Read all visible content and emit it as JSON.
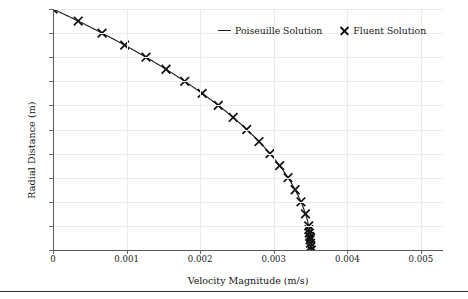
{
  "chart_data": {
    "type": "line",
    "title": "",
    "xlabel": "Velocity Magnitude (m/s)",
    "ylabel": "Radial Distance (m)",
    "xlim": [
      0,
      0.0053
    ],
    "ylim": [
      0,
      0.1
    ],
    "grid": true,
    "legend_position": "top-center",
    "xticks": [
      0,
      0.001,
      0.002,
      0.003,
      0.004,
      0.005
    ],
    "xticklabels": [
      "0",
      "0.001",
      "0.002",
      "0.003",
      "0.004",
      "0.005"
    ],
    "yticks": [
      0,
      0.01,
      0.02,
      0.03,
      0.04,
      0.05,
      0.06,
      0.07,
      0.08,
      0.09,
      0.1
    ],
    "yticklabels": [
      "0",
      "0.01",
      "0.02",
      "0.03",
      "0.04",
      "0.05",
      "0.06",
      "0.07",
      "0.08",
      "0.09",
      "0.1"
    ],
    "series": [
      {
        "name": "Poiseuille Solution",
        "style": "line",
        "color": "#232323",
        "x": [
          0.0,
          5.29e-05,
          0.0001052,
          0.000157,
          0.0002082,
          0.0002588,
          0.0003088,
          0.0003582,
          0.000407,
          0.0004553,
          0.0005029,
          0.00055,
          0.0005965,
          0.0006424,
          0.0006877,
          0.0007324,
          0.0007766,
          0.0008201,
          0.0008631,
          0.0009055,
          0.0009473,
          0.0009885,
          0.0010291,
          0.0010691,
          0.0011086,
          0.0011475,
          0.0011857,
          0.0012234,
          0.0012606,
          0.0012971,
          0.0013331,
          0.0013684,
          0.0014032,
          0.0014375,
          0.0014711,
          0.0015041,
          0.0015366,
          0.0015685,
          0.0015998,
          0.0016305,
          0.0016606,
          0.0016902,
          0.0017191,
          0.0017475,
          0.0017753,
          0.0018025,
          0.0018292,
          0.0018552,
          0.0018807,
          0.0019056,
          0.0019299,
          0.0019536,
          0.0019768,
          0.0019993,
          0.0020213,
          0.0020427,
          0.0020635,
          0.0020837,
          0.0021034,
          0.0021224,
          0.0021409,
          0.0021588,
          0.0021761,
          0.0021928,
          0.002209,
          0.0022245,
          0.0022395,
          0.0022539,
          0.0022677,
          0.0022809,
          0.0022935,
          0.0023056,
          0.0023171,
          0.002328,
          0.0023383,
          0.002348,
          0.0023572,
          0.0023657,
          0.0023737,
          0.0023811,
          0.002388,
          0.0023942,
          0.0023999,
          0.0024049,
          0.0024094,
          0.0024133,
          0.0024167,
          0.0024194,
          0.0024216,
          0.0024231,
          0.0024241,
          0.0024246
        ],
        "y": [
          0.1,
          0.0995,
          0.099,
          0.0985,
          0.098,
          0.0975,
          0.097,
          0.0965,
          0.096,
          0.0955,
          0.095,
          0.0945,
          0.094,
          0.0935,
          0.093,
          0.0925,
          0.092,
          0.0915,
          0.091,
          0.0905,
          0.09,
          0.0895,
          0.089,
          0.0885,
          0.088,
          0.0875,
          0.087,
          0.0865,
          0.086,
          0.0855,
          0.085,
          0.0845,
          0.084,
          0.0835,
          0.083,
          0.0825,
          0.082,
          0.0815,
          0.081,
          0.0805,
          0.08,
          0.0795,
          0.079,
          0.0785,
          0.078,
          0.0775,
          0.077,
          0.0765,
          0.076,
          0.0755,
          0.075,
          0.0745,
          0.074,
          0.0735,
          0.073,
          0.0725,
          0.072,
          0.0715,
          0.071,
          0.0705,
          0.07,
          0.0695,
          0.069,
          0.0685,
          0.068,
          0.0675,
          0.067,
          0.0665,
          0.066,
          0.0655,
          0.065,
          0.0645,
          0.064,
          0.0635,
          0.063,
          0.0625,
          0.062,
          0.0615,
          0.061,
          0.0605,
          0.06,
          0.0595,
          0.059,
          0.0585,
          0.058,
          0.0575,
          0.057,
          0.0565,
          0.056,
          0.0555,
          0.055,
          0.0545
        ]
      },
      {
        "name": "Fluent Solution",
        "style": "marker",
        "marker": "x",
        "color": "#111111",
        "x": [
          0.0,
          0.00026,
          0.00051,
          0.00075,
          0.00098,
          0.0012,
          0.00141,
          0.00161,
          0.0018,
          0.00198,
          0.00215,
          0.00231,
          0.00246,
          0.0026,
          0.00273,
          0.00285,
          0.00296,
          0.00306,
          0.00315,
          0.00323,
          0.0033,
          0.00336,
          0.00341,
          0.00345,
          0.00348,
          0.0035,
          0.00351
        ],
        "y": [
          0.1,
          0.095,
          0.09,
          0.085,
          0.08,
          0.075,
          0.07,
          0.065,
          0.06,
          0.055,
          0.05,
          0.045,
          0.04,
          0.035,
          0.03,
          0.025,
          0.02,
          0.015,
          0.01,
          0.005,
          0.0,
          0.0,
          0.0,
          0.0,
          0.0,
          0.0,
          0.0
        ]
      }
    ]
  },
  "legend": {
    "items": [
      {
        "label": "Poiseuille Solution",
        "marker": "line-icon"
      },
      {
        "label": "Fluent Solution",
        "marker": "x-marker-icon"
      }
    ]
  }
}
